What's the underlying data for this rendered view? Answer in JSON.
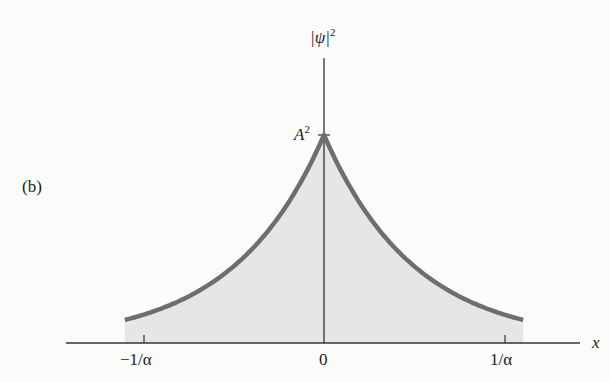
{
  "figure": {
    "panel_label": "(b)",
    "y_axis_label": "|ψ|",
    "y_axis_label_exp": "2",
    "x_axis_label": "x",
    "peak_label": "A",
    "peak_label_exp": "2",
    "x_ticks": [
      "−1/α",
      "0",
      "1/α"
    ],
    "colors": {
      "curve": "#6e6e6e",
      "fill": "#e6e6e4",
      "axis": "#333333",
      "background": "#fbfbfa"
    }
  },
  "chart_data": {
    "type": "area",
    "title": "",
    "function": "|ψ(x)|^2 = A^2 e^{-2α|x|}",
    "xlabel": "x",
    "ylabel": "|ψ|^2",
    "x_ticks": [
      "-1/α",
      "0",
      "1/α"
    ],
    "y_ticks": [
      "A^2"
    ],
    "x_range_alpha_units": [
      -1.1,
      1.1
    ],
    "series": [
      {
        "name": "|ψ|^2",
        "x_alpha_units": [
          -1.1,
          -1.0,
          -0.75,
          -0.5,
          -0.25,
          0,
          0.25,
          0.5,
          0.75,
          1.0,
          1.1
        ],
        "values_A2_units": [
          0.111,
          0.135,
          0.223,
          0.368,
          0.607,
          1.0,
          0.607,
          0.368,
          0.223,
          0.135,
          0.111
        ]
      }
    ],
    "grid": false,
    "legend": "none"
  }
}
